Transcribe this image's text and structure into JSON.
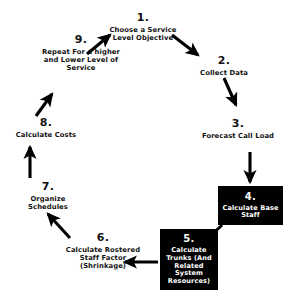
{
  "diagram": {
    "type": "cycle-flowchart",
    "background_color": "#ffffff",
    "line_color": "#000000",
    "box_fill_color": "#000000",
    "box_text_color": "#ffffff"
  },
  "nodes": [
    {
      "id": "1",
      "number": "1.",
      "label": "Choose a Service Level Objective",
      "style": "plain"
    },
    {
      "id": "2",
      "number": "2.",
      "label": "Collect Data",
      "style": "plain"
    },
    {
      "id": "3",
      "number": "3.",
      "label": "Forecast Call Load",
      "style": "plain"
    },
    {
      "id": "4",
      "number": "4.",
      "label": "Calculate Base Staff",
      "style": "boxed"
    },
    {
      "id": "5",
      "number": "5.",
      "label": "Calculate Trunks (And Related System Resources)",
      "style": "boxed"
    },
    {
      "id": "6",
      "number": "6.",
      "label": "Calculate Rostered Staff Factor (Shrinkage)",
      "style": "plain"
    },
    {
      "id": "7",
      "number": "7.",
      "label": "Organize Schedules",
      "style": "plain"
    },
    {
      "id": "8",
      "number": "8.",
      "label": "Calculate Costs",
      "style": "plain"
    },
    {
      "id": "9",
      "number": "9.",
      "label": "Repeat For a higher and Lower Level of Service",
      "style": "plain"
    }
  ],
  "arrows": [
    {
      "from": "9",
      "to": "1",
      "direction": "up-right"
    },
    {
      "from": "1",
      "to": "2",
      "direction": "down-right"
    },
    {
      "from": "2",
      "to": "3",
      "direction": "down-right"
    },
    {
      "from": "3",
      "to": "4",
      "direction": "down"
    },
    {
      "from": "4",
      "to": "5",
      "direction": "down-left"
    },
    {
      "from": "5",
      "to": "6",
      "direction": "left"
    },
    {
      "from": "6",
      "to": "7",
      "direction": "up-left"
    },
    {
      "from": "7",
      "to": "8",
      "direction": "up"
    },
    {
      "from": "8",
      "to": "9",
      "direction": "up-right"
    }
  ]
}
